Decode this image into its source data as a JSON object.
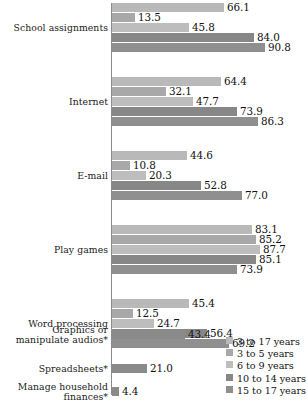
{
  "chart_data": {
    "type": "bar",
    "orientation": "horizontal",
    "title": "",
    "subtitle": "",
    "xlabel": "",
    "ylabel": "",
    "xlim": [
      0,
      100
    ],
    "grid": false,
    "legend_position": "bottom-right",
    "categories": [
      "School assignments",
      "Internet",
      "E-mail",
      "Play games",
      "Word processing",
      "Graphics or manipulate audios*",
      "Spreadsheets*",
      "Manage household finances*"
    ],
    "series": [
      {
        "name": "3 to 17 years",
        "color": "#b9b9b9",
        "values": [
          66.1,
          64.4,
          44.6,
          83.1,
          45.4,
          43.4,
          21.0,
          4.4
        ]
      },
      {
        "name": "3 to 5 years",
        "color": "#a8a8a8",
        "values": [
          13.5,
          32.1,
          10.8,
          85.2,
          12.5,
          null,
          null,
          null
        ]
      },
      {
        "name": "6 to 9 years",
        "color": "#bdbdbd",
        "values": [
          45.8,
          47.7,
          20.3,
          87.7,
          24.7,
          null,
          null,
          null
        ]
      },
      {
        "name": "10 to 14 years",
        "color": "#878787",
        "values": [
          84.0,
          73.9,
          52.8,
          85.1,
          56.4,
          null,
          null,
          null
        ]
      },
      {
        "name": "15 to 17 years",
        "color": "#8f8f8f",
        "values": [
          90.8,
          86.3,
          77.0,
          73.9,
          69.2,
          null,
          null,
          null
        ]
      }
    ]
  },
  "groups": [
    {
      "label_lines": [
        "School assignments"
      ],
      "bars": [
        {
          "series": "3 to 17 years",
          "value": "66.1",
          "color": "#b9b9b9"
        },
        {
          "series": "3 to 5 years",
          "value": "13.5",
          "color": "#a8a8a8"
        },
        {
          "series": "6 to 9 years",
          "value": "45.8",
          "color": "#bdbdbd"
        },
        {
          "series": "10 to 14 years",
          "value": "84.0",
          "color": "#878787"
        },
        {
          "series": "15 to 17 years",
          "value": "90.8",
          "color": "#8f8f8f"
        }
      ]
    },
    {
      "label_lines": [
        "Internet"
      ],
      "bars": [
        {
          "series": "3 to 17 years",
          "value": "64.4",
          "color": "#b9b9b9"
        },
        {
          "series": "3 to 5 years",
          "value": "32.1",
          "color": "#a8a8a8"
        },
        {
          "series": "6 to 9 years",
          "value": "47.7",
          "color": "#bdbdbd"
        },
        {
          "series": "10 to 14 years",
          "value": "73.9",
          "color": "#878787"
        },
        {
          "series": "15 to 17 years",
          "value": "86.3",
          "color": "#8f8f8f"
        }
      ]
    },
    {
      "label_lines": [
        "E-mail"
      ],
      "bars": [
        {
          "series": "3 to 17 years",
          "value": "44.6",
          "color": "#b9b9b9"
        },
        {
          "series": "3 to 5 years",
          "value": "10.8",
          "color": "#a8a8a8"
        },
        {
          "series": "6 to 9 years",
          "value": "20.3",
          "color": "#bdbdbd"
        },
        {
          "series": "10 to 14 years",
          "value": "52.8",
          "color": "#878787"
        },
        {
          "series": "15 to 17 years",
          "value": "77.0",
          "color": "#8f8f8f"
        }
      ]
    },
    {
      "label_lines": [
        "Play games"
      ],
      "bars": [
        {
          "series": "3 to 17 years",
          "value": "83.1",
          "color": "#b9b9b9"
        },
        {
          "series": "3 to 5 years",
          "value": "85.2",
          "color": "#a8a8a8"
        },
        {
          "series": "6 to 9 years",
          "value": "87.7",
          "color": "#bdbdbd"
        },
        {
          "series": "10 to 14 years",
          "value": "85.1",
          "color": "#878787"
        },
        {
          "series": "15 to 17 years",
          "value": "73.9",
          "color": "#8f8f8f"
        }
      ]
    },
    {
      "label_lines": [
        "Word processing"
      ],
      "bars": [
        {
          "series": "3 to 17 years",
          "value": "45.4",
          "color": "#b9b9b9"
        },
        {
          "series": "3 to 5 years",
          "value": "12.5",
          "color": "#a8a8a8"
        },
        {
          "series": "6 to 9 years",
          "value": "24.7",
          "color": "#bdbdbd"
        },
        {
          "series": "10 to 14 years",
          "value": "56.4",
          "color": "#878787"
        },
        {
          "series": "15 to 17 years",
          "value": "69.2",
          "color": "#8f8f8f"
        }
      ]
    },
    {
      "label_lines": [
        "Graphics or",
        "manipulate audios*"
      ],
      "bars": [
        {
          "series": "3 to 17 years",
          "value": "43.4",
          "color": "#8a8a8a"
        }
      ]
    },
    {
      "label_lines": [
        "Spreadsheets*"
      ],
      "bars": [
        {
          "series": "3 to 17 years",
          "value": "21.0",
          "color": "#8a8a8a"
        }
      ]
    },
    {
      "label_lines": [
        "Manage household",
        "finances*"
      ],
      "bars": [
        {
          "series": "3 to 17 years",
          "value": "4.4",
          "color": "#8a8a8a"
        }
      ]
    }
  ],
  "legend": {
    "items": [
      {
        "label": "3 to 17 years",
        "color": "#b9b9b9"
      },
      {
        "label": "3 to 5 years",
        "color": "#a8a8a8"
      },
      {
        "label": "6 to 9 years",
        "color": "#bdbdbd"
      },
      {
        "label": "10 to 14 years",
        "color": "#878787"
      },
      {
        "label": "15 to 17 years",
        "color": "#8f8f8f"
      }
    ]
  },
  "layout": {
    "px_per_unit": 1.69,
    "axis_x": 111,
    "group_tops": [
      5,
      83,
      161,
      239,
      317,
      395,
      473,
      551
    ]
  }
}
